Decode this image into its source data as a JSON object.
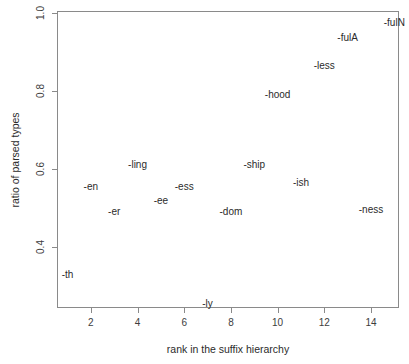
{
  "chart_data": {
    "type": "scatter",
    "title": "",
    "xlabel": "rank in the suffix hierarchy",
    "ylabel": "ratio of parsed types",
    "xlim": [
      0.55,
      15.2
    ],
    "ylim": [
      0.245,
      1.005
    ],
    "grid": false,
    "legend": null,
    "marker_style": "text-label",
    "xticks": [
      2,
      4,
      6,
      8,
      10,
      12,
      14
    ],
    "xticklabels": [
      "2",
      "4",
      "6",
      "8",
      "10",
      "12",
      "14"
    ],
    "yticks": [
      0.4,
      0.6,
      0.8,
      1.0
    ],
    "yticklabels": [
      "0.4",
      "0.6",
      "0.8",
      "1.0"
    ],
    "points": [
      {
        "label": "-th",
        "x": 1,
        "y": 0.33
      },
      {
        "label": "-en",
        "x": 2,
        "y": 0.555
      },
      {
        "label": "-er",
        "x": 3,
        "y": 0.49
      },
      {
        "label": "-ling",
        "x": 4,
        "y": 0.61
      },
      {
        "label": "-ee",
        "x": 5,
        "y": 0.52
      },
      {
        "label": "-ess",
        "x": 6,
        "y": 0.555
      },
      {
        "label": "-ly",
        "x": 7,
        "y": 0.255
      },
      {
        "label": "-dom",
        "x": 8,
        "y": 0.49
      },
      {
        "label": "-ship",
        "x": 9,
        "y": 0.61
      },
      {
        "label": "-hood",
        "x": 10,
        "y": 0.79
      },
      {
        "label": "-ish",
        "x": 11,
        "y": 0.565
      },
      {
        "label": "-less",
        "x": 12,
        "y": 0.865
      },
      {
        "label": "-fulA",
        "x": 13,
        "y": 0.935
      },
      {
        "label": "-ness",
        "x": 14,
        "y": 0.495
      },
      {
        "label": "-fulN",
        "x": 15,
        "y": 0.975
      }
    ]
  },
  "axis": {
    "x_title": "rank in the suffix hierarchy",
    "y_title": "ratio of parsed types"
  }
}
